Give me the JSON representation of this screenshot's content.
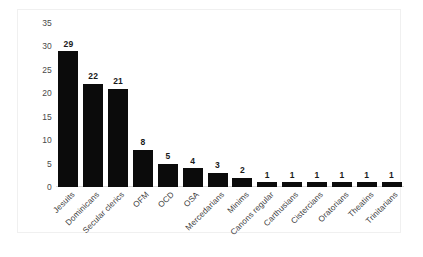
{
  "chart_data": {
    "type": "bar",
    "title": "",
    "subtitle": "",
    "xlabel": "",
    "ylabel": "",
    "categories": [
      "Jesuits",
      "Dominicans",
      "Secular clerics",
      "OFM",
      "OCD",
      "OSA",
      "Mercedarians",
      "Minims",
      "Canons regular",
      "Carthusians",
      "Cistercians",
      "Oratorians",
      "Theatins",
      "Trinitarians"
    ],
    "values": [
      29,
      22,
      21,
      8,
      5,
      4,
      3,
      2,
      1,
      1,
      1,
      1,
      1,
      1
    ],
    "data_labels": [
      "29",
      "22",
      "21",
      "8",
      "5",
      "4",
      "3",
      "2",
      "1",
      "1",
      "1",
      "1",
      "1",
      "1"
    ],
    "ylim": [
      0,
      35
    ],
    "ytick_labels": [
      "0",
      "5",
      "10",
      "15",
      "20",
      "25",
      "30",
      "35"
    ],
    "ytick_values": [
      0,
      5,
      10,
      15,
      20,
      25,
      30,
      35
    ],
    "grid": false,
    "legend": false,
    "legend_position": "none",
    "bar_color": "#0b0b0b",
    "background_color": "#ffffff",
    "axis_color": "#d9d9d9",
    "tick_label_color": "#4a4a4a",
    "xlabel_rotation": -45
  }
}
